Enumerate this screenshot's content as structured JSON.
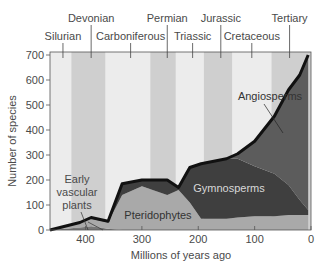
{
  "chart_data": {
    "type": "area",
    "title": "",
    "xlabel": "Millions of years ago",
    "ylabel": "Number of species",
    "xlim": [
      463,
      0
    ],
    "ylim": [
      0,
      700
    ],
    "x_ticks": [
      400,
      300,
      200,
      100,
      0
    ],
    "y_ticks": [
      0,
      100,
      200,
      300,
      400,
      500,
      600,
      700
    ],
    "grid": false,
    "periods": [
      {
        "name": "Silurian",
        "mya": 440,
        "row": 2
      },
      {
        "name": "Devonian",
        "mya": 390,
        "row": 1
      },
      {
        "name": "Carboniferous",
        "mya": 320,
        "row": 2
      },
      {
        "name": "Permian",
        "mya": 255,
        "row": 1
      },
      {
        "name": "Triassic",
        "mya": 210,
        "row": 2
      },
      {
        "name": "Jurassic",
        "mya": 160,
        "row": 1
      },
      {
        "name": "Cretaceous",
        "mya": 105,
        "row": 2
      },
      {
        "name": "Tertiary",
        "mya": 38,
        "row": 1
      }
    ],
    "period_bands": [
      {
        "from": 425,
        "to": 365
      },
      {
        "from": 285,
        "to": 240
      },
      {
        "from": 190,
        "to": 140
      },
      {
        "from": 70,
        "to": 0
      }
    ],
    "x": [
      463,
      410,
      390,
      360,
      335,
      300,
      255,
      235,
      215,
      195,
      150,
      130,
      100,
      65,
      40,
      20,
      5
    ],
    "series": [
      {
        "name": "Early vascular plants",
        "values": [
          0,
          10,
          15,
          5,
          0,
          0,
          0,
          0,
          0,
          0,
          0,
          0,
          0,
          0,
          0,
          0,
          0
        ]
      },
      {
        "name": "Pteridophytes",
        "values": [
          0,
          20,
          30,
          25,
          140,
          175,
          140,
          160,
          110,
          45,
          45,
          50,
          55,
          55,
          60,
          60,
          60
        ]
      },
      {
        "name": "Gymnosperms",
        "values": [
          0,
          0,
          5,
          5,
          45,
          25,
          60,
          10,
          140,
          220,
          240,
          235,
          200,
          170,
          120,
          60,
          20
        ]
      },
      {
        "name": "Angiosperms",
        "values": [
          0,
          0,
          0,
          0,
          0,
          0,
          0,
          0,
          0,
          0,
          0,
          20,
          100,
          230,
          380,
          500,
          620
        ]
      }
    ],
    "totals": [
      0,
      30,
      50,
      35,
      200,
      205,
      205,
      175,
      260,
      285,
      300,
      305,
      355,
      455,
      560,
      620,
      700
    ],
    "annotations": [
      {
        "text": "Early",
        "line2": "vascular",
        "line3": "plants",
        "points_to_mya": 400
      },
      {
        "text": "Pteridophytes"
      },
      {
        "text": "Gymnosperms"
      },
      {
        "text": "Angiosperms"
      }
    ]
  },
  "labels": {
    "xlabel": "Millions of years ago",
    "ylabel": "Number of species",
    "early1": "Early",
    "early2": "vascular",
    "early3": "plants",
    "pterido": "Pteridophytes",
    "gymno": "Gymnosperms",
    "angio": "Angiosperms"
  },
  "colors": {
    "band_light": "#ececec",
    "band_dark": "#cfcfcf",
    "pteridophytes": "#a9a9a9",
    "gymnosperms": "#3f3f3f",
    "angiosperms": "#5c5c5c",
    "outline": "#111111"
  }
}
